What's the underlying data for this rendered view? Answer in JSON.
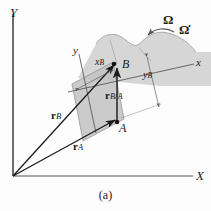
{
  "figure": {
    "caption": "(a)",
    "background_color": "#fdfdfd",
    "line_color": "#1a1a1a",
    "body_fill": "#d6d6d6",
    "parallelogram_fill": "#c9c9c9"
  },
  "axes": {
    "global": {
      "x_label": "X",
      "y_label": "Y"
    },
    "local": {
      "x_label": "x",
      "y_label": "y"
    }
  },
  "points": [
    {
      "name": "point-a",
      "label": "A"
    },
    {
      "name": "point-b",
      "label": "B"
    }
  ],
  "vectors": [
    {
      "name": "vector-r-a",
      "symbol": "r",
      "subscript": "A"
    },
    {
      "name": "vector-r-b",
      "symbol": "r",
      "subscript": "B"
    },
    {
      "name": "vector-r-b-over-a",
      "symbol": "r",
      "subscript": "B/A"
    }
  ],
  "dimensions": [
    {
      "name": "dimension-x-b",
      "symbol": "x",
      "subscript": "B"
    },
    {
      "name": "dimension-y-b",
      "symbol": "y",
      "subscript": "B"
    }
  ],
  "rotation": {
    "omega": "Ω",
    "omega_dot": "Ω̇",
    "arrow_direction": "counterclockwise"
  }
}
